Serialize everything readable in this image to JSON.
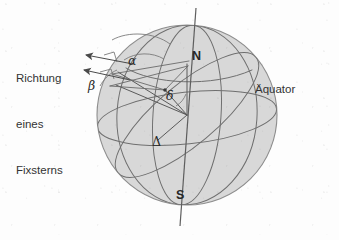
{
  "figure": {
    "kind": "celestial-sphere-diagram",
    "language": "de",
    "background_color": "#fdfdfd",
    "sphere": {
      "fill_color": "#d8d8d8",
      "outline_color": "#8d8d8d",
      "center_x": 187,
      "center_y": 115,
      "radius": 90
    },
    "line_color": "#6f6f6f",
    "ray_color": "#5a5a5a",
    "text_color": "#2e2e2e"
  },
  "caption": {
    "line1": "Richtung",
    "line2": "eines",
    "line3": "Fixsterns"
  },
  "labels": {
    "alpha": "α",
    "beta": "β",
    "delta": "δ",
    "big_delta": "Δ",
    "north_pole": "N",
    "south_pole": "S",
    "equator": "Äquator"
  },
  "elements": {
    "polar_axis": "polar-axis",
    "equator_circle": "equator-circle",
    "meridian_circles": 3,
    "star_direction_arrows": 2
  }
}
